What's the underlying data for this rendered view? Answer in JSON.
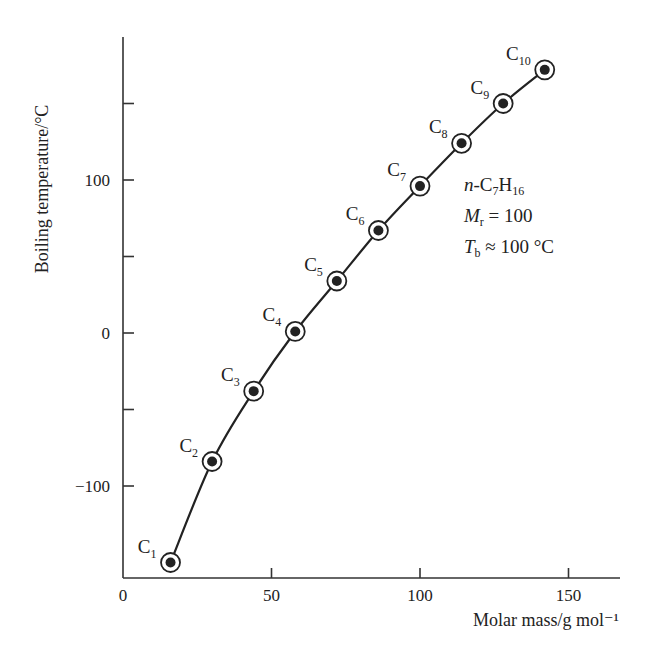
{
  "chart_data": {
    "type": "line",
    "title": "",
    "xlabel": "Molar mass/g mol⁻¹",
    "ylabel": "Boiling temperature/°C",
    "xlim": [
      0,
      168
    ],
    "ylim": [
      -160,
      200
    ],
    "x_ticks": [
      0,
      50,
      100,
      150
    ],
    "y_ticks": [
      -100,
      -50,
      0,
      50,
      100,
      150
    ],
    "y_tick_labels": [
      "−100",
      "",
      "0",
      "",
      "100",
      ""
    ],
    "grid": false,
    "legend": null,
    "series": [
      {
        "name": "n-alkanes",
        "marker": "circled-dot",
        "points": [
          {
            "label": "C1",
            "x": 16,
            "y": -150
          },
          {
            "label": "C2",
            "x": 30,
            "y": -84
          },
          {
            "label": "C3",
            "x": 44,
            "y": -38
          },
          {
            "label": "C4",
            "x": 58,
            "y": 1
          },
          {
            "label": "C5",
            "x": 72,
            "y": 34
          },
          {
            "label": "C6",
            "x": 86,
            "y": 67
          },
          {
            "label": "C7",
            "x": 100,
            "y": 96
          },
          {
            "label": "C8",
            "x": 114,
            "y": 124
          },
          {
            "label": "C9",
            "x": 128,
            "y": 150
          },
          {
            "label": "C10",
            "x": 142,
            "y": 172
          }
        ]
      }
    ],
    "annotations": [
      {
        "text": "n-C7H16"
      },
      {
        "text": "Mr = 100"
      },
      {
        "text": "Tb ≈ 100 °C"
      }
    ]
  },
  "annotation": {
    "line1": {
      "prefix": "n",
      "mid": "-C",
      "sub1": "7",
      "h": "H",
      "sub2": "16"
    },
    "line2": {
      "sym": "M",
      "sub": "r",
      "rest": " = 100"
    },
    "line3": {
      "sym": "T",
      "sub": "b",
      "rest": " ≈ 100 °C"
    }
  }
}
